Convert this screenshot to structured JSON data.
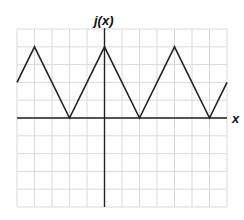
{
  "chart_data": {
    "type": "line",
    "title": "",
    "xlabel": "x",
    "ylabel": "j(x)",
    "xlim": [
      -5,
      7
    ],
    "ylim": [
      -5,
      5
    ],
    "grid": true,
    "tick_labels_shown": false,
    "series": [
      {
        "name": "j(x)",
        "x": [
          -5,
          -4,
          -2,
          0,
          2,
          4,
          6,
          7
        ],
        "y": [
          2,
          4,
          0,
          4,
          0,
          4,
          0,
          2
        ]
      }
    ],
    "colors": {
      "grid": "#d9d9d9",
      "axis": "#222222",
      "line": "#222222"
    }
  }
}
